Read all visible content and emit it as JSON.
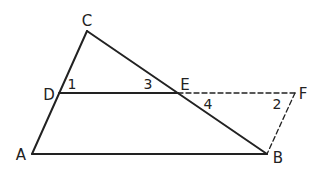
{
  "diagram": {
    "type": "geometry",
    "colors": {
      "stroke": "#222222",
      "background": "#ffffff"
    },
    "points": {
      "A": {
        "label": "A",
        "x": 32,
        "y": 154
      },
      "B": {
        "label": "B",
        "x": 267,
        "y": 154
      },
      "C": {
        "label": "C",
        "x": 87,
        "y": 31
      },
      "D": {
        "label": "D",
        "x": 59,
        "y": 93
      },
      "E": {
        "label": "E",
        "x": 178,
        "y": 93
      },
      "F": {
        "label": "F",
        "x": 295,
        "y": 93
      }
    },
    "segments": [
      {
        "from": "A",
        "to": "C",
        "style": "solid"
      },
      {
        "from": "C",
        "to": "B",
        "style": "solid"
      },
      {
        "from": "A",
        "to": "B",
        "style": "solid"
      },
      {
        "from": "D",
        "to": "E",
        "style": "solid"
      },
      {
        "from": "E",
        "to": "F",
        "style": "dashed"
      },
      {
        "from": "F",
        "to": "B",
        "style": "dashed"
      }
    ],
    "angle_labels": [
      {
        "label": "1",
        "x": 72,
        "y": 89
      },
      {
        "label": "3",
        "x": 148,
        "y": 89
      },
      {
        "label": "4",
        "x": 208,
        "y": 109
      },
      {
        "label": "2",
        "x": 277,
        "y": 109
      }
    ],
    "vertex_labels": [
      {
        "label": "C",
        "x": 87,
        "y": 26
      },
      {
        "label": "D",
        "x": 49,
        "y": 100
      },
      {
        "label": "E",
        "x": 185,
        "y": 90
      },
      {
        "label": "F",
        "x": 303,
        "y": 99
      },
      {
        "label": "A",
        "x": 21,
        "y": 160
      },
      {
        "label": "B",
        "x": 278,
        "y": 163
      }
    ]
  }
}
